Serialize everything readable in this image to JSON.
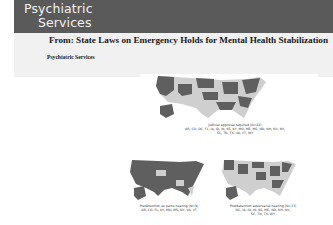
{
  "header": {
    "brand_line1": "Psychiatric",
    "brand_line2": "Services"
  },
  "article": {
    "from_title": "From: State Laws on Emergency Holds for Mental Health Stabilization",
    "source": "Psychiatric Services"
  },
  "figure": {
    "maps": [
      {
        "caption_line1": "Judicial approval required (N=22)",
        "caption_line2": "AR, CO, DC, FL, IA, ID, IN, KS, KY, MO, ME, MS, ND, NH, NV, NY,",
        "caption_line3": "SC, TN, TX, VA, VT, WY"
      },
      {
        "caption_line1": "Predetention ex parte hearing (N=9)",
        "caption_line2": "AR, CO, FL, KY, MO, MS, NY, VA, VT",
        "caption_line3": ""
      },
      {
        "caption_line1": "Postdetention adversarial hearing (N=13)",
        "caption_line2": "DC, IA, ID, IN, KS, ME, ND, NH, NV,",
        "caption_line3": "SC, TN, TX, WY"
      }
    ],
    "colors": {
      "highlighted": "#5f5f5f",
      "other": "#cfcfcf"
    }
  }
}
